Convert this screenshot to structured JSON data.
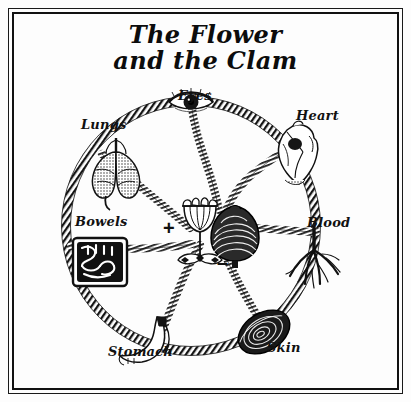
{
  "plate": {
    "title_line1": "The Flower",
    "title_line2": "and the Clam",
    "background_color": "#fdfdfd",
    "ink_color": "#111111"
  },
  "center": {
    "flower": {
      "icon": "tulip-flower-icon",
      "polarity_symbol": "+"
    },
    "clam": {
      "icon": "clam-shell-icon",
      "polarity_symbol": "–"
    }
  },
  "wheel": {
    "organs": [
      {
        "label": "Eyes",
        "icon": "eye-icon",
        "angle_deg": -90
      },
      {
        "label": "Heart",
        "icon": "heart-icon",
        "angle_deg": -38
      },
      {
        "label": "Blood",
        "icon": "blood-vessel-icon",
        "angle_deg": 12
      },
      {
        "label": "Skin",
        "icon": "skin-icon",
        "angle_deg": 62
      },
      {
        "label": "Stomach",
        "icon": "stomach-icon",
        "angle_deg": 112
      },
      {
        "label": "Bowels",
        "icon": "bowels-icon",
        "angle_deg": 168
      },
      {
        "label": "Lungs",
        "icon": "lungs-icon",
        "angle_deg": -142
      }
    ]
  }
}
